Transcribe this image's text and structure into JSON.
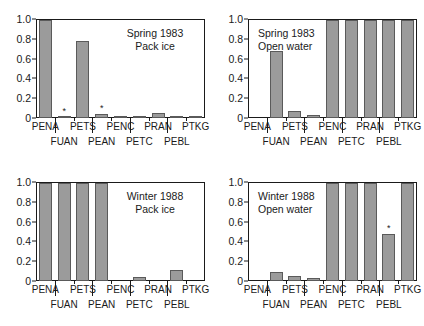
{
  "figure": {
    "categories": [
      "PENA",
      "FUAN",
      "PETS",
      "PEAN",
      "PENC",
      "PETC",
      "PRAN",
      "PEBL",
      "PTKG"
    ],
    "ytick_labels": [
      "1.0",
      "0.8",
      "0.6",
      "0.4",
      "0.2",
      "0"
    ],
    "ytick_values": [
      1.0,
      0.8,
      0.6,
      0.4,
      0.2,
      0
    ],
    "xlabels_row1": [
      "PENA",
      "PETS",
      "PENC",
      "PRAN",
      "PTKG"
    ],
    "xlabels_row2": [
      "FUAN",
      "PEAN",
      "PETC",
      "PEBL"
    ],
    "marker_symbol": "*",
    "bar_fill": "#9b9b9b",
    "bar_stroke": "#5a5a5a",
    "axis_color": "#1a1a1a"
  },
  "chart_data": [
    {
      "type": "bar",
      "title": "Spring 1983",
      "subtitle": "Pack ice",
      "panel_id": "spring-1983-pack-ice",
      "categories": [
        "PENA",
        "FUAN",
        "PETS",
        "PEAN",
        "PENC",
        "PETC",
        "PRAN",
        "PEBL",
        "PTKG"
      ],
      "values": [
        1.0,
        0.015,
        0.79,
        0.045,
        0.02,
        0.02,
        0.05,
        0.02,
        0.02
      ],
      "markers": [
        "",
        "*",
        "",
        "*",
        "",
        "",
        "",
        "",
        ""
      ],
      "xlabel": "",
      "ylabel": "",
      "ylim": [
        0,
        1.0
      ],
      "grid": false,
      "legend": "none"
    },
    {
      "type": "bar",
      "title": "Spring 1983",
      "subtitle": "Open water",
      "panel_id": "spring-1983-open-water",
      "categories": [
        "PENA",
        "FUAN",
        "PETS",
        "PEAN",
        "PENC",
        "PETC",
        "PRAN",
        "PEBL",
        "PTKG"
      ],
      "values": [
        0.0,
        0.68,
        0.07,
        0.035,
        1.0,
        1.0,
        1.0,
        1.0,
        1.0
      ],
      "markers": [
        "",
        "",
        "",
        "",
        "",
        "",
        "",
        "",
        ""
      ],
      "xlabel": "",
      "ylabel": "",
      "ylim": [
        0,
        1.0
      ],
      "grid": false,
      "legend": "none"
    },
    {
      "type": "bar",
      "title": "Winter 1988",
      "subtitle": "Pack ice",
      "panel_id": "winter-1988-pack-ice",
      "categories": [
        "PENA",
        "FUAN",
        "PETS",
        "PEAN",
        "PENC",
        "PETC",
        "PRAN",
        "PEBL",
        "PTKG"
      ],
      "values": [
        1.0,
        1.0,
        1.0,
        1.0,
        0.0,
        0.045,
        0.0,
        0.11,
        0.0
      ],
      "markers": [
        "",
        "",
        "",
        "",
        "",
        "",
        "",
        "",
        ""
      ],
      "xlabel": "",
      "ylabel": "",
      "ylim": [
        0,
        1.0
      ],
      "grid": false,
      "legend": "none"
    },
    {
      "type": "bar",
      "title": "Winter 1988",
      "subtitle": "Open water",
      "panel_id": "winter-1988-open-water",
      "categories": [
        "PENA",
        "FUAN",
        "PETS",
        "PEAN",
        "PENC",
        "PETC",
        "PRAN",
        "PEBL",
        "PTKG"
      ],
      "values": [
        0.0,
        0.095,
        0.055,
        0.03,
        1.0,
        1.0,
        1.0,
        0.48,
        1.0
      ],
      "markers": [
        "",
        "",
        "",
        "",
        "",
        "",
        "",
        "*",
        ""
      ],
      "xlabel": "",
      "ylabel": "",
      "ylim": [
        0,
        1.0
      ],
      "grid": false,
      "legend": "none"
    }
  ]
}
